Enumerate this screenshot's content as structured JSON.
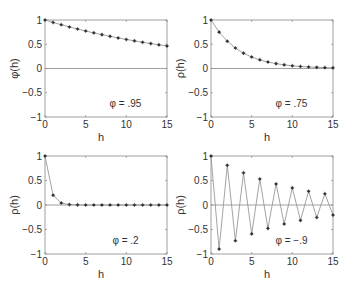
{
  "chart_data": [
    {
      "type": "line",
      "title": "",
      "annotation": "φ = .95",
      "xlabel": "h",
      "ylabel": "φ(h)",
      "xlim": [
        0,
        15
      ],
      "ylim": [
        -1,
        1
      ],
      "xticks": [
        "0",
        "5",
        "10",
        "15"
      ],
      "yticks": [
        "-1",
        "-0.5",
        "0",
        "0.5",
        "1"
      ],
      "grid": false,
      "x": [
        0,
        1,
        2,
        3,
        4,
        5,
        6,
        7,
        8,
        9,
        10,
        11,
        12,
        13,
        14,
        15
      ],
      "values": [
        1.0,
        0.95,
        0.9025,
        0.857,
        0.815,
        0.774,
        0.735,
        0.698,
        0.663,
        0.63,
        0.599,
        0.569,
        0.54,
        0.513,
        0.488,
        0.463
      ]
    },
    {
      "type": "line",
      "title": "",
      "annotation": "φ = .75",
      "xlabel": "h",
      "ylabel": "ρ(h)",
      "xlim": [
        0,
        15
      ],
      "ylim": [
        -1,
        1
      ],
      "xticks": [
        "0",
        "5",
        "10",
        "15"
      ],
      "yticks": [
        "-1",
        "-0.5",
        "0",
        "0.5",
        "1"
      ],
      "grid": false,
      "x": [
        0,
        1,
        2,
        3,
        4,
        5,
        6,
        7,
        8,
        9,
        10,
        11,
        12,
        13,
        14,
        15
      ],
      "values": [
        1.0,
        0.75,
        0.5625,
        0.422,
        0.316,
        0.237,
        0.178,
        0.133,
        0.1,
        0.075,
        0.056,
        0.042,
        0.032,
        0.024,
        0.018,
        0.013
      ]
    },
    {
      "type": "line",
      "title": "",
      "annotation": "φ = .2",
      "xlabel": "h",
      "ylabel": "ρ(h)",
      "xlim": [
        0,
        15
      ],
      "ylim": [
        -1,
        1
      ],
      "xticks": [
        "0",
        "5",
        "10",
        "15"
      ],
      "yticks": [
        "-1",
        "-0.5",
        "0",
        "0.5",
        "1"
      ],
      "grid": false,
      "x": [
        0,
        1,
        2,
        3,
        4,
        5,
        6,
        7,
        8,
        9,
        10,
        11,
        12,
        13,
        14,
        15
      ],
      "values": [
        1.0,
        0.2,
        0.04,
        0.008,
        0.0016,
        0.0003,
        0,
        0,
        0,
        0,
        0,
        0,
        0,
        0,
        0,
        0
      ]
    },
    {
      "type": "line",
      "title": "",
      "annotation": "φ = −.9",
      "xlabel": "h",
      "ylabel": "ρ(h)",
      "xlim": [
        0,
        15
      ],
      "ylim": [
        -1,
        1
      ],
      "xticks": [
        "0",
        "5",
        "10",
        "15"
      ],
      "yticks": [
        "-1",
        "-0.5",
        "0",
        "0.5",
        "1"
      ],
      "grid": false,
      "x": [
        0,
        1,
        2,
        3,
        4,
        5,
        6,
        7,
        8,
        9,
        10,
        11,
        12,
        13,
        14,
        15
      ],
      "values": [
        1.0,
        -0.9,
        0.81,
        -0.729,
        0.656,
        -0.59,
        0.531,
        -0.478,
        0.43,
        -0.387,
        0.349,
        -0.314,
        0.282,
        -0.254,
        0.229,
        -0.206
      ]
    }
  ],
  "panels": [
    {
      "annotation": "φ = .95",
      "ylabel": "φ(h)",
      "xlabel": "h"
    },
    {
      "annotation": "φ = .75",
      "ylabel": "ρ(h)",
      "xlabel": "h"
    },
    {
      "annotation": "φ = .2",
      "ylabel": "ρ(h)",
      "xlabel": "h"
    },
    {
      "annotation": "φ = −.9",
      "ylabel": "ρ(h)",
      "xlabel": "h"
    }
  ],
  "ticks": {
    "x": [
      "0",
      "5",
      "10",
      "15"
    ],
    "y": [
      "−1",
      "−0.5",
      "0",
      "0.5",
      "1"
    ]
  },
  "colors": {
    "axes": "#888888",
    "line": "#999999",
    "marker": "#333333",
    "text": "#333333"
  }
}
